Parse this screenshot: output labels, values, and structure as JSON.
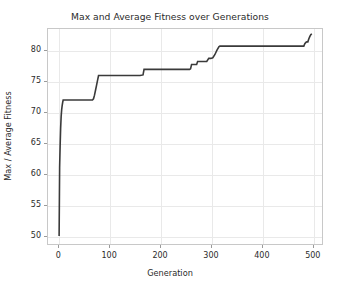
{
  "chart_data": {
    "type": "line",
    "title": "Max and Average Fitness over Generations",
    "xlabel": "Generation",
    "ylabel": "Max / Average Fitness",
    "xlim": [
      -22,
      520
    ],
    "ylim": [
      48.5,
      83.6
    ],
    "xticks": [
      0,
      100,
      200,
      300,
      400,
      500
    ],
    "yticks": [
      50,
      55,
      60,
      65,
      70,
      75,
      80
    ],
    "grid": true,
    "legend": null,
    "line_color": "#3a3a3a",
    "line_width": 1.6,
    "series": [
      {
        "name": "Max Fitness",
        "x": [
          0,
          1,
          2,
          3,
          4,
          5,
          6,
          7,
          8,
          40,
          66,
          68,
          70,
          72,
          74,
          76,
          78,
          120,
          160,
          166,
          168,
          200,
          240,
          258,
          260,
          262,
          272,
          274,
          282,
          284,
          292,
          296,
          300,
          304,
          308,
          312,
          316,
          318,
          320,
          360,
          420,
          470,
          484,
          486,
          488,
          490,
          492,
          494,
          496,
          498,
          500
        ],
        "y": [
          49.8,
          61.0,
          64.5,
          67.4,
          69.3,
          70.4,
          71.1,
          71.6,
          72.0,
          72.0,
          72.0,
          72.2,
          72.8,
          73.6,
          74.4,
          75.2,
          76.0,
          76.0,
          76.0,
          76.1,
          77.0,
          77.0,
          77.0,
          77.0,
          77.1,
          77.8,
          77.8,
          78.3,
          78.3,
          78.3,
          78.3,
          78.8,
          78.8,
          78.9,
          79.4,
          80.1,
          80.7,
          80.8,
          80.8,
          80.8,
          80.8,
          80.8,
          80.8,
          81.2,
          81.4,
          81.5,
          81.5,
          82.0,
          82.4,
          82.7,
          82.8
        ]
      }
    ]
  }
}
